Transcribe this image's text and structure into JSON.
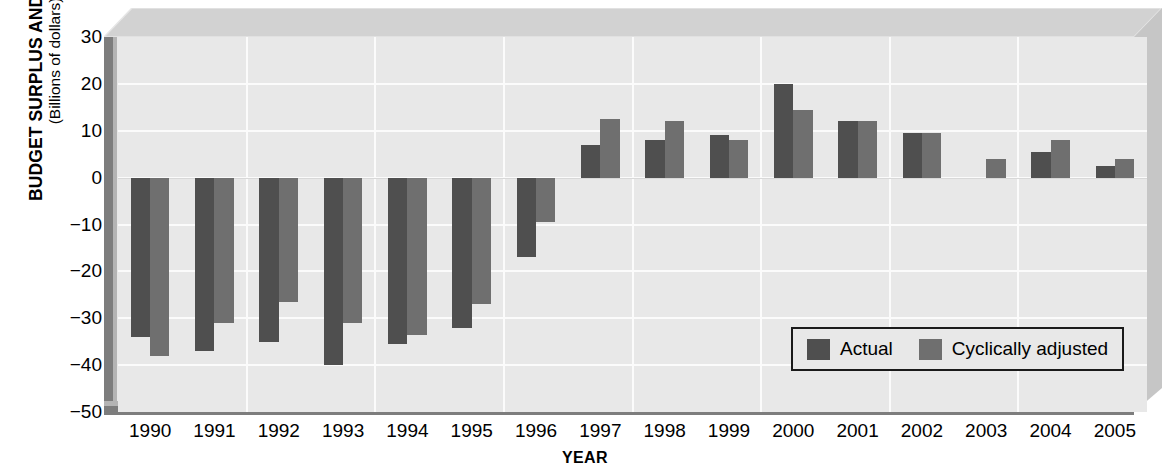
{
  "chart_data": {
    "type": "bar",
    "title": "",
    "ylabel": "BUDGET SURPLUS AND DEFICIT",
    "ylabel_sub": "(Billions of dollars)",
    "xlabel": "YEAR",
    "ylim": [
      -50,
      30
    ],
    "ytick_step": 10,
    "yticks": [
      "30",
      "20",
      "10",
      "0",
      "−10",
      "−20",
      "−30",
      "−40",
      "−50"
    ],
    "ytick_values": [
      30,
      20,
      10,
      0,
      -10,
      -20,
      -30,
      -40,
      -50
    ],
    "grid": true,
    "legend_position": "inside-lower-right",
    "categories": [
      "1990",
      "1991",
      "1992",
      "1993",
      "1994",
      "1995",
      "1996",
      "1997",
      "1998",
      "1999",
      "2000",
      "2001",
      "2002",
      "2003",
      "2004",
      "2005"
    ],
    "series": [
      {
        "name": "Actual",
        "color": "#4f4f4f",
        "values": [
          -34,
          -37,
          -35,
          -40,
          -35.5,
          -32,
          -17,
          7,
          8,
          9,
          20,
          12,
          9.5,
          0,
          5.5,
          2.5
        ]
      },
      {
        "name": "Cyclically adjusted",
        "color": "#6f6f6f",
        "values": [
          -38,
          -31,
          -26.5,
          -31,
          -33.5,
          -27,
          -9.5,
          12.5,
          12,
          8,
          14.5,
          12,
          9.5,
          4,
          8,
          4
        ]
      }
    ]
  },
  "legend": {
    "items": [
      {
        "label": "Actual",
        "swatch": "actual"
      },
      {
        "label": "Cyclically adjusted",
        "swatch": "adjusted"
      }
    ]
  },
  "colors": {
    "actual": "#4f4f4f",
    "adjusted": "#6f6f6f",
    "plot_background": "#e8e8e8",
    "gridline": "#fbfbfb",
    "slab_top": "#d4d4d4",
    "slab_side": "#c9c9c9",
    "axis": "#7a7a7a"
  }
}
